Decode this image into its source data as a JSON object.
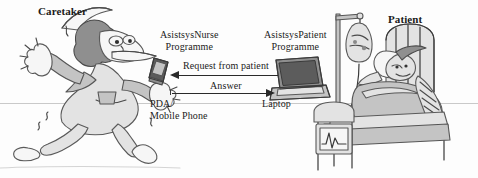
{
  "figure": {
    "canvas": {
      "width": 478,
      "height": 178,
      "background": "#fdfdfd"
    },
    "ink_color": "#4a4a4a",
    "text_color": "#1b1b1b",
    "horizon_color": "#c9c9c9"
  },
  "labels": {
    "caretaker": "Caretaker",
    "patient": "Patient",
    "nurse_programme_line1": "AsistsysNurse",
    "nurse_programme_line2": "Programme",
    "patient_programme_line1": "AsistsysPatient",
    "patient_programme_line2": "Programme",
    "device_left_line1": "PDA/",
    "device_left_line2": "Mobile Phone",
    "device_right": "Laptop"
  },
  "arrows": [
    {
      "name": "request-arrow",
      "label": "Request from  patient",
      "direction": "left"
    },
    {
      "name": "answer-arrow",
      "label": "Answer",
      "direction": "right"
    }
  ],
  "actors": [
    {
      "name": "caretaker-figure",
      "description": "running nurse caretaker cartoon"
    },
    {
      "name": "patient-figure",
      "description": "patient lying in hospital bed"
    }
  ],
  "objects": [
    {
      "name": "pda-device",
      "description": "handheld PDA / mobile phone"
    },
    {
      "name": "laptop-device",
      "description": "open laptop computer"
    },
    {
      "name": "iv-drip-stand",
      "description": "intravenous drip stand with fluid bag"
    },
    {
      "name": "hospital-bed",
      "description": "hospital bed with rails"
    },
    {
      "name": "bedside-monitor",
      "description": "monitor showing ECG trace"
    }
  ]
}
